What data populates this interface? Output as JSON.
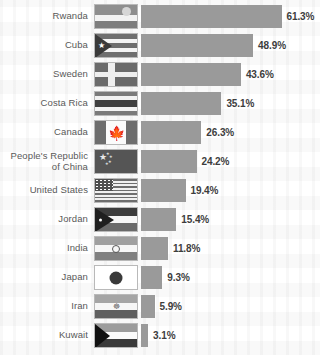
{
  "chart_data": {
    "type": "bar",
    "orientation": "horizontal",
    "title": "",
    "xlabel": "",
    "ylabel": "",
    "xlim": [
      0,
      61.3
    ],
    "grid": false,
    "legend": false,
    "value_suffix": "%",
    "categories": [
      "Rwanda",
      "Cuba",
      "Sweden",
      "Costa Rica",
      "Canada",
      "People's Republic\nof China",
      "United States",
      "Jordan",
      "India",
      "Japan",
      "Iran",
      "Kuwait"
    ],
    "values": [
      61.3,
      48.9,
      43.6,
      35.1,
      26.3,
      24.2,
      19.4,
      15.4,
      11.8,
      9.3,
      5.9,
      3.1
    ],
    "value_labels": [
      "61.3%",
      "48.9%",
      "43.6%",
      "35.1%",
      "26.3%",
      "24.2%",
      "19.4%",
      "15.4%",
      "11.8%",
      "9.3%",
      "5.9%",
      "3.1%"
    ]
  },
  "rows": [
    {
      "country": "Rwanda",
      "flag": "flag-rwanda",
      "value_label": "61.3%",
      "value": 61.3
    },
    {
      "country": "Cuba",
      "flag": "flag-cuba",
      "value_label": "48.9%",
      "value": 48.9
    },
    {
      "country": "Sweden",
      "flag": "flag-sweden",
      "value_label": "43.6%",
      "value": 43.6
    },
    {
      "country": "Costa Rica",
      "flag": "flag-costa-rica",
      "value_label": "35.1%",
      "value": 35.1
    },
    {
      "country": "Canada",
      "flag": "flag-canada",
      "value_label": "26.3%",
      "value": 26.3
    },
    {
      "country": "People's Republic\nof China",
      "flag": "flag-china",
      "value_label": "24.2%",
      "value": 24.2
    },
    {
      "country": "United States",
      "flag": "flag-united-states",
      "value_label": "19.4%",
      "value": 19.4
    },
    {
      "country": "Jordan",
      "flag": "flag-jordan",
      "value_label": "15.4%",
      "value": 15.4
    },
    {
      "country": "India",
      "flag": "flag-india",
      "value_label": "11.8%",
      "value": 11.8
    },
    {
      "country": "Japan",
      "flag": "flag-japan",
      "value_label": "9.3%",
      "value": 9.3
    },
    {
      "country": "Iran",
      "flag": "flag-iran",
      "value_label": "5.9%",
      "value": 5.9
    },
    {
      "country": "Kuwait",
      "flag": "flag-kuwait",
      "value_label": "3.1%",
      "value": 3.1
    }
  ],
  "style": {
    "bar_color": "#9a9a9a",
    "label_color": "#595959",
    "value_color": "#3d3d3d",
    "background": "#ffffff"
  }
}
